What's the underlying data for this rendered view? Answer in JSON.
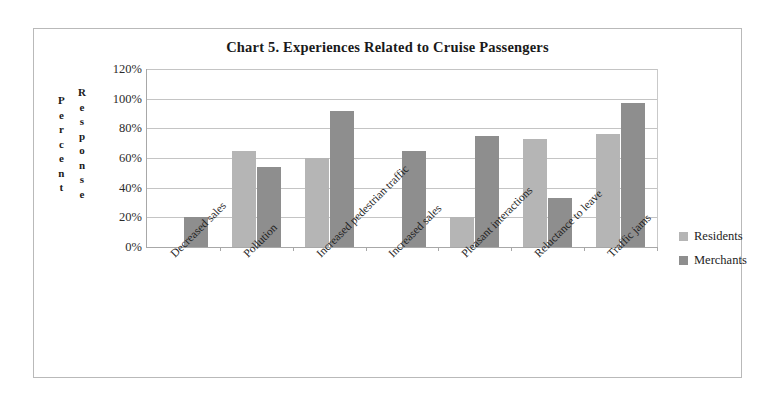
{
  "chart_data": {
    "type": "bar",
    "title": "Chart 5. Experiences  Related to Cruise  Passengers",
    "xlabel": "",
    "ylabel": "Percent Response",
    "ylabel_lines": [
      "Percent",
      "Response"
    ],
    "ylim": [
      0,
      120
    ],
    "ytick_labels": [
      "120%",
      "100%",
      "80%",
      "60%",
      "40%",
      "20%",
      "0%"
    ],
    "ytick_values": [
      120,
      100,
      80,
      60,
      40,
      20,
      0
    ],
    "grid": true,
    "legend_position": "right",
    "categories": [
      "Decreased sales",
      "Pollution",
      "Increased pedestrian traffic",
      "Increased sales",
      "Pleasant interactions",
      "Reluctance to leave",
      "Traffic jams"
    ],
    "series": [
      {
        "name": "Residents",
        "color": "#b5b5b5",
        "values": [
          null,
          65,
          60,
          null,
          20,
          73,
          76
        ]
      },
      {
        "name": "Merchants",
        "color": "#8e8e8e",
        "values": [
          20,
          54,
          92,
          65,
          75,
          33,
          97
        ]
      }
    ]
  },
  "legend": {
    "items": [
      {
        "label": "Residents",
        "color": "#b5b5b5"
      },
      {
        "label": "Merchants",
        "color": "#8e8e8e"
      }
    ]
  }
}
